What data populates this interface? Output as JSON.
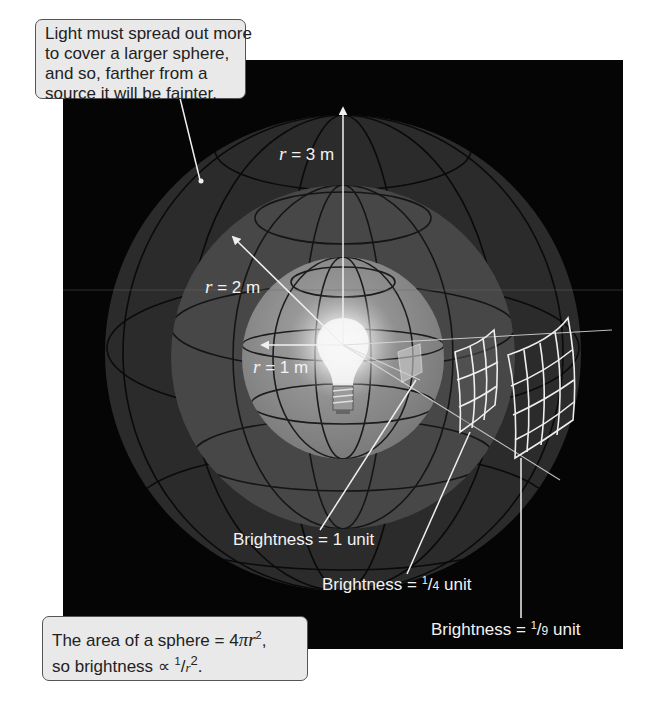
{
  "figure": {
    "panel_color": "#050505",
    "sphere_colors": {
      "outer": "#2a2a2a",
      "middle": "#474747",
      "inner": "#8c8c8c"
    },
    "line_color": "#f0f0f0",
    "callout_bg": "#e9e9e9"
  },
  "radii_labels": [
    {
      "var": "r",
      "text": " = 3 m"
    },
    {
      "var": "r",
      "text": " = 2 m"
    },
    {
      "var": "r",
      "text": " = 1 m"
    }
  ],
  "brightness_labels": [
    {
      "prefix": "Brightness = ",
      "value": "1",
      "suffix": " unit"
    },
    {
      "prefix": "Brightness = ",
      "num": "1",
      "den": "4",
      "suffix": " unit"
    },
    {
      "prefix": "Brightness = ",
      "num": "1",
      "den": "9",
      "suffix": " unit"
    }
  ],
  "callout_top": {
    "lines": [
      "Light must spread out more",
      "to cover a larger sphere,",
      "and so, farther from a",
      "source it will be fainter."
    ]
  },
  "callout_bottom": {
    "line1_prefix": "The area of a sphere = 4",
    "pi": "π",
    "r": "r",
    "exp": "2",
    "line1_suffix": ",",
    "line2_prefix": "so brightness ",
    "propto": "∝",
    "num": "1",
    "slash": "/",
    "r2": "r",
    "exp2": "2",
    "line2_suffix": "."
  }
}
